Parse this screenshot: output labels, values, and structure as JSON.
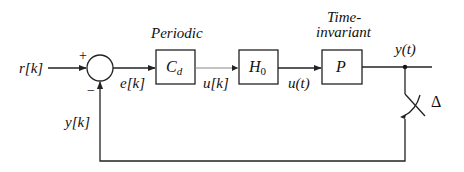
{
  "diagram": {
    "type": "block-diagram",
    "signals": {
      "reference": "r[k]",
      "error": "e[k]",
      "discrete_control": "u[k]",
      "continuous_control": "u(t)",
      "continuous_output": "y(t)",
      "sampled_output": "y[k]"
    },
    "summing_junction": {
      "plus_sign": "+",
      "minus_sign": "−"
    },
    "blocks": [
      {
        "id": "controller",
        "label": "C",
        "subscript": "d",
        "annotation": "Periodic"
      },
      {
        "id": "hold",
        "label": "H",
        "subscript": "0",
        "annotation": ""
      },
      {
        "id": "plant",
        "label": "P",
        "subscript": "",
        "annotation_line1": "Time-",
        "annotation_line2": "invariant"
      }
    ],
    "sampler": {
      "label": "Δ"
    },
    "edges": [
      {
        "from": "r[k]",
        "to": "summing_junction",
        "sign": "+"
      },
      {
        "from": "summing_junction",
        "to": "controller",
        "signal": "e[k]"
      },
      {
        "from": "controller",
        "to": "hold",
        "signal": "u[k]"
      },
      {
        "from": "hold",
        "to": "plant",
        "signal": "u(t)"
      },
      {
        "from": "plant",
        "to": "output",
        "signal": "y(t)"
      },
      {
        "from": "output",
        "to": "sampler",
        "signal": "y(t)"
      },
      {
        "from": "sampler",
        "to": "summing_junction",
        "signal": "y[k]",
        "sign": "−"
      }
    ]
  }
}
